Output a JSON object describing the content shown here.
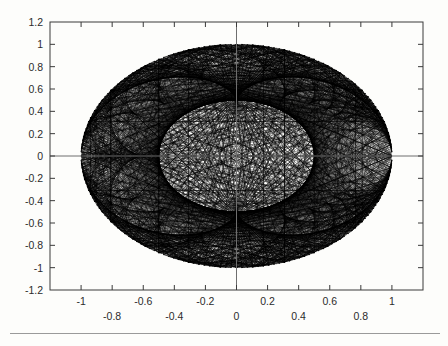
{
  "figure": {
    "title": "",
    "background_color": "#fdfdfb",
    "plot_area": {
      "left": 50,
      "top": 22,
      "right": 423,
      "bottom": 290
    }
  },
  "chart_data": {
    "type": "line",
    "title": "",
    "subtitle": "",
    "xlabel": "",
    "ylabel": "",
    "grid": false,
    "legend": null,
    "xlim": [
      -1.2,
      1.2
    ],
    "ylim": [
      -1.2,
      1.2
    ],
    "xticks": [
      -1.2,
      -1,
      -0.8,
      -0.6,
      -0.4,
      -0.2,
      0,
      0.2,
      0.4,
      0.6,
      0.8,
      1,
      1.2
    ],
    "yticks": [
      -1.2,
      -1,
      -0.8,
      -0.6,
      -0.4,
      -0.2,
      0,
      0.2,
      0.4,
      0.6,
      0.8,
      1,
      1.2
    ],
    "xticklabels_row1": [
      "-1",
      "-0.6",
      "-0.2",
      "0.2",
      "0.6",
      "1"
    ],
    "xticklabels_row1_values": [
      -1,
      -0.6,
      -0.2,
      0.2,
      0.6,
      1
    ],
    "xticklabels_row2": [
      "-0.8",
      "-0.4",
      "0",
      "0.4",
      "0.8"
    ],
    "xticklabels_row2_values": [
      -0.8,
      -0.4,
      0,
      0.4,
      0.8
    ],
    "yticklabels": [
      "1.2",
      "1",
      "0.8",
      "0.6",
      "0.4",
      "0.2",
      "0",
      "-0.2",
      "-0.4",
      "-0.6",
      "-0.8",
      "-1",
      "-1.2"
    ],
    "yticklabels_values": [
      1.2,
      1,
      0.8,
      0.6,
      0.4,
      0.2,
      0,
      -0.2,
      -0.4,
      -0.6,
      -0.8,
      -1,
      -1.2
    ],
    "zero_lines": {
      "x": 0,
      "y": 0
    },
    "series": [
      {
        "name": "chord-envelope",
        "generator": "chords",
        "n_points": 180,
        "multiplier": 3,
        "circle_radius": 1.0,
        "inner_caustic_radius": 0.5,
        "color": "#000000",
        "linewidth": 0.38
      }
    ]
  },
  "footer": {
    "rule_color": "#9a9a9a"
  }
}
